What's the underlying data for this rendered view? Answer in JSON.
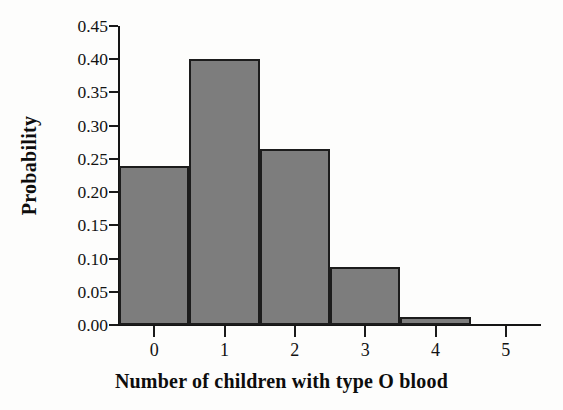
{
  "chart_data": {
    "type": "bar",
    "title": "",
    "xlabel": "Number of children with type O blood",
    "ylabel": "Probability",
    "categories": [
      "0",
      "1",
      "2",
      "3",
      "4",
      "5"
    ],
    "values": [
      0.24,
      0.4,
      0.265,
      0.088,
      0.012,
      0.0
    ],
    "ylim": [
      0.0,
      0.45
    ],
    "xlim": [
      -0.5,
      5.5
    ],
    "ytick_labels": [
      "0.00",
      "0.05",
      "0.10",
      "0.15",
      "0.20",
      "0.25",
      "0.30",
      "0.35",
      "0.40",
      "0.45"
    ],
    "ytick_values": [
      0.0,
      0.05,
      0.1,
      0.15,
      0.2,
      0.25,
      0.3,
      0.35,
      0.4,
      0.45
    ],
    "xtick_labels": [
      "0",
      "1",
      "2",
      "3",
      "4",
      "5"
    ],
    "grid": false,
    "legend": null,
    "bar_color": "#7d7d7d",
    "bar_edge_color": "#1c1c1c",
    "axis_color": "#151515",
    "background_color": "#fdfdfc"
  }
}
